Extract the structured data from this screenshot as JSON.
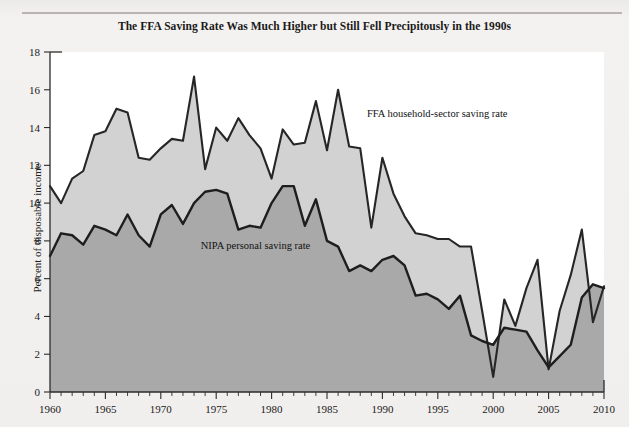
{
  "figure": {
    "title": "The FFA Saving Rate Was Much Higher but Still Fell Precipitously in the 1990s",
    "ylabel": "Percent of disposable income",
    "annotations": {
      "ffa": "FFA household-sector saving rate",
      "nipa": "NIPA personal saving rate"
    }
  },
  "colors": {
    "ffa_area": "#d2d2d2",
    "nipa_area": "#a9a9a9",
    "line": "#262626",
    "page_background": "#f2f0ee",
    "plot_background": "#ffffff"
  },
  "chart_data": {
    "type": "area",
    "title": "The FFA Saving Rate Was Much Higher but Still Fell Precipitously in the 1990s",
    "xlabel": "",
    "ylabel": "Percent of disposable income",
    "xlim": [
      1960,
      2010
    ],
    "ylim": [
      0,
      18
    ],
    "yticks": [
      0,
      2,
      4,
      6,
      8,
      10,
      12,
      14,
      16,
      18
    ],
    "xticks": [
      1960,
      1965,
      1970,
      1975,
      1980,
      1985,
      1990,
      1995,
      2000,
      2005,
      2010
    ],
    "xtick_labels": [
      "1960",
      "1965",
      "1970",
      "1975",
      "1980",
      "1985",
      "1990",
      "1995",
      "2000",
      "2005",
      "2010"
    ],
    "ytick_labels": [
      "0",
      "2",
      "4",
      "6",
      "8",
      "10",
      "12",
      "14",
      "16",
      "18"
    ],
    "minor_xticks_interval": 1,
    "grid": false,
    "legend_position": "inline-annotation",
    "x": [
      1960,
      1961,
      1962,
      1963,
      1964,
      1965,
      1966,
      1967,
      1968,
      1969,
      1970,
      1971,
      1972,
      1973,
      1974,
      1975,
      1976,
      1977,
      1978,
      1979,
      1980,
      1981,
      1982,
      1983,
      1984,
      1985,
      1986,
      1987,
      1988,
      1989,
      1990,
      1991,
      1992,
      1993,
      1994,
      1995,
      1996,
      1997,
      1998,
      1999,
      2000,
      2001,
      2002,
      2003,
      2004,
      2005,
      2006,
      2007,
      2008,
      2009,
      2010
    ],
    "series": [
      {
        "name": "FFA household-sector saving rate",
        "label_anchor_year": 1988,
        "values": [
          10.9,
          10.0,
          11.3,
          11.7,
          13.6,
          13.8,
          15.0,
          14.8,
          12.4,
          12.3,
          12.9,
          13.4,
          13.3,
          16.7,
          11.8,
          14.0,
          13.3,
          14.5,
          13.6,
          12.9,
          11.3,
          13.9,
          13.1,
          13.2,
          15.4,
          12.8,
          16.0,
          13.0,
          12.9,
          8.7,
          12.4,
          10.5,
          9.3,
          8.4,
          8.3,
          8.1,
          8.1,
          7.7,
          7.7,
          4.3,
          0.8,
          4.9,
          3.5,
          5.5,
          7.0,
          1.2,
          4.3,
          6.2,
          8.6,
          3.7,
          5.6
        ]
      },
      {
        "name": "NIPA personal saving rate",
        "label_anchor_year": 1975,
        "values": [
          7.2,
          8.4,
          8.3,
          7.8,
          8.8,
          8.6,
          8.3,
          9.4,
          8.3,
          7.7,
          9.4,
          9.9,
          8.9,
          10.0,
          10.6,
          10.7,
          10.5,
          8.6,
          8.8,
          8.7,
          10.0,
          10.9,
          10.9,
          8.8,
          10.2,
          8.0,
          7.7,
          6.4,
          6.7,
          6.4,
          7.0,
          7.2,
          6.7,
          5.1,
          5.2,
          4.9,
          4.4,
          5.1,
          3.0,
          2.7,
          2.5,
          3.4,
          3.3,
          3.2,
          2.2,
          1.3,
          1.9,
          2.5,
          5.0,
          5.7,
          5.5
        ]
      }
    ]
  }
}
